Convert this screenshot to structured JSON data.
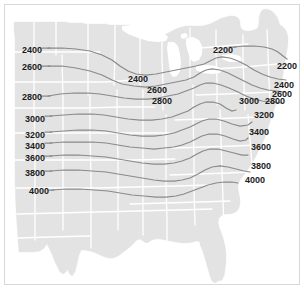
{
  "figure": {
    "type": "contour-map",
    "region": "Eastern and Central United States",
    "title": "",
    "units": "",
    "colors": {
      "background": "#ffffff",
      "land_fill": "#e3e3e3",
      "state_border": "#ffffff",
      "contour_line": "#8a8a8a",
      "frame_border": "#d8d8d8",
      "label_text": "#1c1c1c"
    }
  },
  "chart_data": {
    "type": "contour",
    "title": "",
    "xlabel": "",
    "ylabel": "",
    "contour_interval": 200,
    "levels": [
      2200,
      2400,
      2600,
      2800,
      3000,
      3200,
      3400,
      3600,
      3800,
      4000
    ],
    "legend": "none",
    "grid": false,
    "labels": [
      {
        "id": "left-2400",
        "value": "2400",
        "x": 22,
        "y": 45,
        "side": "left"
      },
      {
        "id": "left-2600",
        "value": "2600",
        "x": 22,
        "y": 62,
        "side": "left"
      },
      {
        "id": "left-2800",
        "value": "2800",
        "x": 22,
        "y": 92,
        "side": "left"
      },
      {
        "id": "left-3000",
        "value": "3000",
        "x": 25,
        "y": 114,
        "side": "left"
      },
      {
        "id": "left-3200",
        "value": "3200",
        "x": 25,
        "y": 130,
        "side": "left"
      },
      {
        "id": "left-3400",
        "value": "3400",
        "x": 25,
        "y": 141,
        "side": "left"
      },
      {
        "id": "left-3600",
        "value": "3600",
        "x": 25,
        "y": 153,
        "side": "left"
      },
      {
        "id": "left-3800",
        "value": "3800",
        "x": 25,
        "y": 168,
        "side": "left"
      },
      {
        "id": "left-4000",
        "value": "4000",
        "x": 29,
        "y": 186,
        "side": "left"
      },
      {
        "id": "mid-2400",
        "value": "2400",
        "x": 128,
        "y": 74,
        "side": "middle"
      },
      {
        "id": "mid-2600",
        "value": "2600",
        "x": 147,
        "y": 85,
        "side": "middle"
      },
      {
        "id": "mid-2800",
        "value": "2800",
        "x": 152,
        "y": 96,
        "side": "middle"
      },
      {
        "id": "right-2200a",
        "value": "2200",
        "x": 213,
        "y": 45,
        "side": "right"
      },
      {
        "id": "right-2200b",
        "value": "2200",
        "x": 277,
        "y": 61,
        "side": "right"
      },
      {
        "id": "right-2400",
        "value": "2400",
        "x": 274,
        "y": 80,
        "side": "right"
      },
      {
        "id": "right-2600",
        "value": "2600",
        "x": 272,
        "y": 89,
        "side": "right"
      },
      {
        "id": "right-2800",
        "value": "2800",
        "x": 265,
        "y": 96,
        "side": "right"
      },
      {
        "id": "right-3000",
        "value": "3000",
        "x": 239,
        "y": 96,
        "side": "right"
      },
      {
        "id": "right-3200",
        "value": "3200",
        "x": 254,
        "y": 110,
        "side": "right"
      },
      {
        "id": "right-3400",
        "value": "3400",
        "x": 249,
        "y": 127,
        "side": "right"
      },
      {
        "id": "right-3600",
        "value": "3600",
        "x": 251,
        "y": 142,
        "side": "right"
      },
      {
        "id": "right-3800",
        "value": "3800",
        "x": 251,
        "y": 161,
        "side": "right"
      },
      {
        "id": "right-4000",
        "value": "4000",
        "x": 245,
        "y": 175,
        "side": "right"
      }
    ]
  }
}
